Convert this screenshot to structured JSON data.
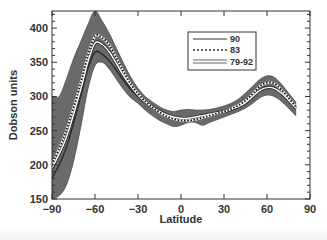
{
  "chart_data": {
    "type": "line",
    "title": "",
    "xlabel": "Latitude",
    "ylabel": "Dobson units",
    "xlim": [
      -90,
      90
    ],
    "ylim": [
      150,
      425
    ],
    "xticks": [
      -90,
      -60,
      -30,
      0,
      30,
      60,
      90
    ],
    "yticks": [
      150,
      200,
      250,
      300,
      350,
      400
    ],
    "grid": false,
    "legend_position": "upper right",
    "series": [
      {
        "name": "90",
        "style": "solid white line with dark edges",
        "x": [
          -90,
          -80,
          -70,
          -65,
          -60,
          -55,
          -50,
          -45,
          -40,
          -35,
          -30,
          -25,
          -20,
          -15,
          -10,
          -5,
          0,
          5,
          10,
          15,
          20,
          25,
          30,
          35,
          40,
          45,
          50,
          55,
          60,
          65,
          70,
          75,
          80
        ],
        "y": [
          195,
          240,
          310,
          350,
          378,
          376,
          365,
          348,
          330,
          315,
          302,
          292,
          284,
          278,
          273,
          270,
          268,
          268,
          270,
          272,
          274,
          276,
          278,
          281,
          285,
          291,
          300,
          309,
          313,
          312,
          305,
          295,
          283
        ]
      },
      {
        "name": "83",
        "style": "dotted",
        "x": [
          -90,
          -80,
          -70,
          -65,
          -60,
          -55,
          -50,
          -45,
          -40,
          -35,
          -30,
          -25,
          -20,
          -15,
          -10,
          -5,
          0,
          5,
          10,
          15,
          20,
          25,
          30,
          35,
          40,
          45,
          50,
          55,
          60,
          65,
          70,
          75,
          80
        ],
        "y": [
          200,
          250,
          320,
          360,
          388,
          386,
          375,
          356,
          336,
          318,
          304,
          293,
          284,
          277,
          271,
          267,
          265,
          265,
          266,
          269,
          272,
          275,
          278,
          282,
          287,
          294,
          304,
          315,
          320,
          319,
          310,
          298,
          285
        ]
      },
      {
        "name": "79-92",
        "style": "shaded band (range)",
        "x": [
          -90,
          -85,
          -80,
          -75,
          -70,
          -65,
          -60,
          -55,
          -50,
          -45,
          -40,
          -35,
          -30,
          -25,
          -20,
          -15,
          -10,
          -5,
          0,
          5,
          10,
          15,
          20,
          25,
          30,
          35,
          40,
          45,
          50,
          55,
          60,
          65,
          70,
          75,
          80
        ],
        "upper": [
          300,
          300,
          325,
          355,
          380,
          405,
          425,
          410,
          392,
          370,
          348,
          328,
          312,
          300,
          292,
          285,
          280,
          278,
          280,
          281,
          280,
          280,
          281,
          283,
          286,
          290,
          296,
          305,
          315,
          325,
          330,
          328,
          318,
          305,
          292
        ],
        "lower": [
          150,
          155,
          170,
          205,
          255,
          310,
          345,
          350,
          340,
          325,
          310,
          298,
          290,
          280,
          272,
          265,
          260,
          256,
          258,
          262,
          262,
          258,
          262,
          266,
          270,
          274,
          278,
          283,
          290,
          298,
          302,
          300,
          293,
          283,
          272
        ]
      },
      {
        "name": "lower inner line",
        "style": "solid dark line",
        "x": [
          -90,
          -80,
          -70,
          -65,
          -60,
          -55,
          -50,
          -45,
          -40,
          -35,
          -30
        ],
        "y": [
          180,
          225,
          300,
          340,
          365,
          362,
          352,
          338,
          323,
          310,
          300
        ]
      }
    ],
    "legend": [
      {
        "label": "90",
        "style": "solid"
      },
      {
        "label": "83",
        "style": "dotted"
      },
      {
        "label": "79-92",
        "style": "double line (band)"
      }
    ]
  }
}
